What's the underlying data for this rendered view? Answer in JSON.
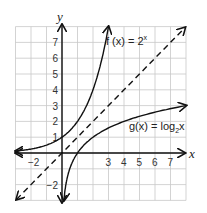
{
  "chart_data": {
    "type": "line",
    "title": "",
    "xlabel": "x",
    "ylabel": "y",
    "xlim": [
      -3,
      8
    ],
    "ylim": [
      -3,
      8
    ],
    "grid": true,
    "x_tick_labels": [
      "-2",
      "3",
      "4",
      "5",
      "6",
      "7"
    ],
    "y_tick_labels": [
      "7",
      "6",
      "5",
      "4",
      "3",
      "2",
      "1",
      "-2"
    ],
    "series": [
      {
        "name": "f(x) = 2^x",
        "label": "f (x) = 2",
        "sup": "x",
        "style": "solid",
        "x": [
          -3,
          -2,
          -1,
          0,
          1,
          2,
          3
        ],
        "y": [
          0.125,
          0.25,
          0.5,
          1,
          2,
          4,
          8
        ]
      },
      {
        "name": "g(x) = log2 x",
        "label": "g(x) = log",
        "sub": "2",
        "tail": "x",
        "style": "solid",
        "x": [
          0.125,
          0.25,
          0.5,
          1,
          2,
          4,
          8
        ],
        "y": [
          -3,
          -2,
          -1,
          0,
          1,
          2,
          3
        ]
      },
      {
        "name": "y = x",
        "style": "dashed",
        "x": [
          -3,
          8
        ],
        "y": [
          -3,
          8
        ]
      }
    ]
  }
}
